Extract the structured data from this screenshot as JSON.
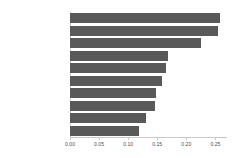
{
  "chart_data": {
    "type": "bar",
    "orientation": "horizontal",
    "title": "",
    "subtitle": "",
    "xlabel": "",
    "ylabel": "",
    "categories": [
      "Title Similarity #1",
      "Binary Pattern",
      "Content Similarity #1",
      "Normalized TF Sum",
      "Binary Query",
      "Normalized TF Max",
      "Excerpt Similarity #2",
      "Title Similarity #2",
      "Normalized TF Average",
      "Excerpt Similarity #1"
    ],
    "values": [
      0.258,
      0.255,
      0.225,
      0.168,
      0.165,
      0.158,
      0.148,
      0.147,
      0.13,
      0.118
    ],
    "xlim": [
      0.0,
      0.27
    ],
    "xticks": [
      0.0,
      0.05,
      0.1,
      0.15,
      0.2,
      0.25
    ],
    "xtick_labels": [
      "0.00",
      "0.05",
      "0.10",
      "0.15",
      "0.20",
      "0.25"
    ],
    "grid": false,
    "legend": null,
    "bar_color": "#595959",
    "axis_color": "#c8c8c8",
    "tick_label_color": "#4a4a4a",
    "category_label_color": "#3a3a3a",
    "background_color": "#ffffff"
  }
}
